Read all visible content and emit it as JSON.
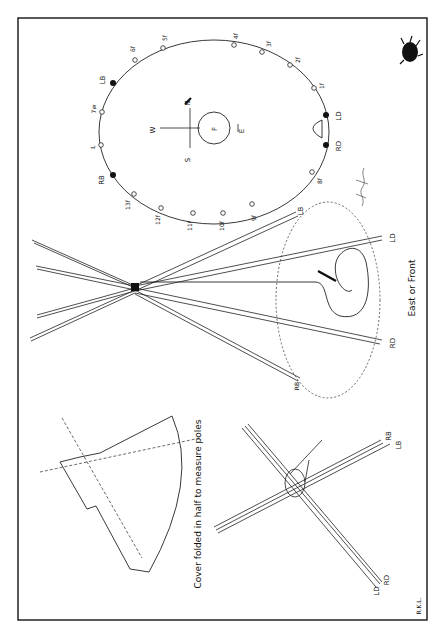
{
  "plan": {
    "fire_label": "F",
    "compass": {
      "north": "N",
      "south": "S",
      "east": "E",
      "west": "W"
    },
    "pole_labels": {
      "lb": "LB",
      "rb": "RB",
      "ld": "LD",
      "rd": "RD",
      "l": "L",
      "w7": "7w",
      "f1": "1f",
      "f2": "2f",
      "f3": "3f",
      "f4": "4f",
      "f5": "5f",
      "f6": "6f",
      "f8": "8f",
      "f9": "9f",
      "f10": "10f",
      "f11": "11f",
      "f12": "12f",
      "f13": "13f"
    }
  },
  "tripod": {
    "labels": {
      "lb": "LB",
      "rb": "RB",
      "ld": "LD",
      "rd": "RD"
    },
    "caption": "East or Front"
  },
  "cover": {
    "caption": "Cover folded in half to measure poles"
  },
  "tie": {
    "labels": {
      "rb": "RB",
      "lb": "LB",
      "rd": "RD",
      "ld": "LD"
    }
  },
  "credit": "R.K.L."
}
